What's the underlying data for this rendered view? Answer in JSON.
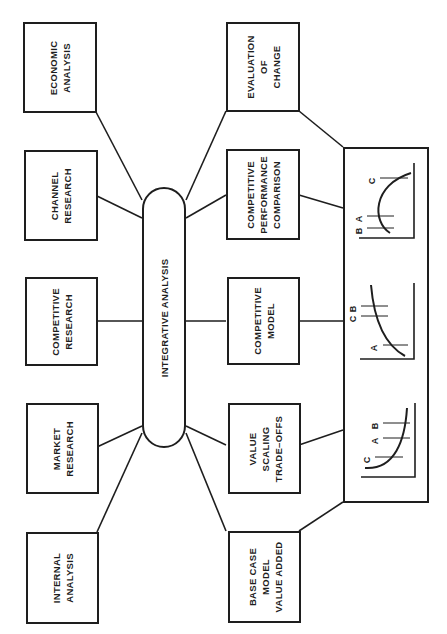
{
  "diagram": {
    "orientation": "rotated-90-ccw",
    "hub": {
      "label": "INTEGRATIVE ANALYSIS"
    },
    "inputs": [
      {
        "id": "economic",
        "label": "ECONOMIC\nANALYSIS"
      },
      {
        "id": "channel",
        "label": "CHANNEL\nRESEARCH"
      },
      {
        "id": "competitive-research",
        "label": "COMPETITIVE\nRESEARCH"
      },
      {
        "id": "market",
        "label": "MARKET\nRESEARCH"
      },
      {
        "id": "internal",
        "label": "INTERNAL\nANALYSIS"
      }
    ],
    "outputs": [
      {
        "id": "evaluation",
        "label": "EVALUATION\nOF\nCHANGE"
      },
      {
        "id": "performance",
        "label": "COMPETITIVE\nPERFORMANCE\nCOMPARISON"
      },
      {
        "id": "model",
        "label": "COMPETITIVE\nMODEL"
      },
      {
        "id": "value-scaling",
        "label": "VALUE\nSCALING\nTRADE–OFFS"
      },
      {
        "id": "base-case",
        "label": "BASE CASE\nMODEL\nVALUE ADDED"
      }
    ],
    "mini_charts": [
      {
        "id": "performance-chart",
        "markers": [
          "B",
          "A",
          "C"
        ],
        "curve": "concave"
      },
      {
        "id": "model-chart",
        "markers": [
          "B",
          "C",
          "A"
        ],
        "curve": "decreasing"
      },
      {
        "id": "value-chart",
        "markers": [
          "C",
          "A",
          "B"
        ],
        "curve": "convex"
      }
    ]
  }
}
